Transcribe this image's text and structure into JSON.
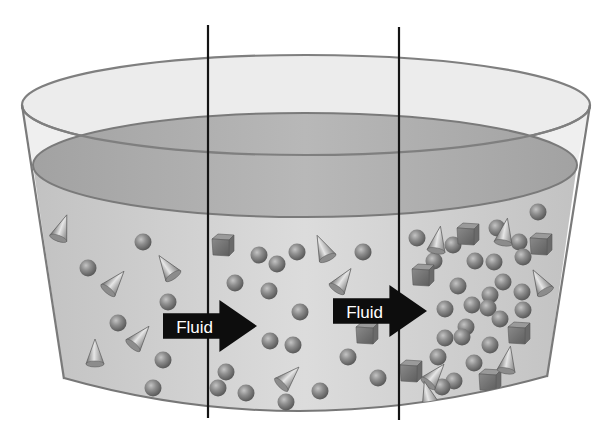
{
  "diagram": {
    "colors": {
      "background": "#ffffff",
      "rim_fill": "#e9e9e9",
      "rim_stroke": "#7a7a7a",
      "fluid_surface": "#a9a9a9",
      "fluid_body": "#cfcfcf",
      "particle": "#8a8a8a",
      "arrow": "#0d0d0d",
      "divider": "#141414"
    },
    "arrows": [
      {
        "label": "Fluid",
        "x": 163,
        "y": 306,
        "width": 94,
        "height": 40
      },
      {
        "label": "Fluid",
        "x": 333,
        "y": 291,
        "width": 94,
        "height": 40
      }
    ],
    "dividers": [
      {
        "name": "left-boundary-line",
        "x": 208,
        "y1": 25,
        "y2": 418
      },
      {
        "name": "right-boundary-line",
        "x": 399,
        "y1": 27,
        "y2": 420
      }
    ],
    "regions": [
      {
        "name": "left-region",
        "description": "sparse mixed particles"
      },
      {
        "name": "middle-region",
        "description": "moderate particles"
      },
      {
        "name": "right-region",
        "description": "dense accumulated particles"
      }
    ],
    "spheres": [
      [
        143,
        242
      ],
      [
        88,
        268
      ],
      [
        168,
        302
      ],
      [
        118,
        323
      ],
      [
        163,
        360
      ],
      [
        153,
        388
      ],
      [
        259,
        255
      ],
      [
        277,
        264
      ],
      [
        297,
        252
      ],
      [
        363,
        252
      ],
      [
        235,
        283
      ],
      [
        269,
        291
      ],
      [
        300,
        312
      ],
      [
        270,
        341
      ],
      [
        293,
        345
      ],
      [
        348,
        357
      ],
      [
        378,
        378
      ],
      [
        226,
        372
      ],
      [
        218,
        388
      ],
      [
        246,
        393
      ],
      [
        286,
        402
      ],
      [
        320,
        391
      ],
      [
        417,
        238
      ],
      [
        453,
        245
      ],
      [
        497,
        228
      ],
      [
        538,
        212
      ],
      [
        519,
        242
      ],
      [
        523,
        257
      ],
      [
        475,
        261
      ],
      [
        494,
        262
      ],
      [
        434,
        261
      ],
      [
        503,
        282
      ],
      [
        522,
        292
      ],
      [
        458,
        286
      ],
      [
        490,
        295
      ],
      [
        472,
        305
      ],
      [
        445,
        309
      ],
      [
        488,
        308
      ],
      [
        523,
        310
      ],
      [
        500,
        319
      ],
      [
        466,
        327
      ],
      [
        445,
        338
      ],
      [
        462,
        337
      ],
      [
        490,
        345
      ],
      [
        438,
        357
      ],
      [
        474,
        363
      ],
      [
        454,
        381
      ],
      [
        442,
        387
      ]
    ],
    "cubes": [
      [
        223,
        245
      ],
      [
        367,
        333
      ],
      [
        468,
        234
      ],
      [
        541,
        244
      ],
      [
        423,
        275
      ],
      [
        519,
        333
      ],
      [
        411,
        371
      ],
      [
        490,
        380
      ]
    ],
    "cones": [
      {
        "x": 62,
        "y": 228,
        "angle": 20
      },
      {
        "x": 115,
        "y": 282,
        "angle": 40
      },
      {
        "x": 167,
        "y": 267,
        "angle": -35
      },
      {
        "x": 140,
        "y": 337,
        "angle": 40
      },
      {
        "x": 95,
        "y": 353,
        "angle": 0
      },
      {
        "x": 323,
        "y": 248,
        "angle": -25
      },
      {
        "x": 343,
        "y": 280,
        "angle": 35
      },
      {
        "x": 289,
        "y": 377,
        "angle": 45
      },
      {
        "x": 438,
        "y": 240,
        "angle": 10
      },
      {
        "x": 505,
        "y": 232,
        "angle": 10
      },
      {
        "x": 540,
        "y": 282,
        "angle": -30
      },
      {
        "x": 508,
        "y": 360,
        "angle": 10
      },
      {
        "x": 435,
        "y": 375,
        "angle": 40
      },
      {
        "x": 428,
        "y": 395,
        "angle": -15
      }
    ]
  }
}
